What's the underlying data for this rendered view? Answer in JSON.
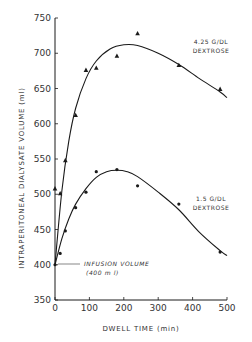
{
  "chart_data": {
    "type": "scatter",
    "title": "",
    "xlabel": "DWELL TIME (min)",
    "ylabel": "INTRAPERITONEAL DIALYSATE VOLUME (ml)",
    "xlim": [
      0,
      500
    ],
    "ylim": [
      350,
      750
    ],
    "xticks": [
      0,
      100,
      200,
      300,
      400,
      500
    ],
    "yticks": [
      350,
      400,
      450,
      500,
      550,
      600,
      650,
      700,
      750
    ],
    "grid": false,
    "legend": "none (series labeled inline)",
    "series": [
      {
        "name": "4.25 G/DL DEXTROSE",
        "marker": "triangle",
        "points": [
          {
            "x": 0,
            "y": 508
          },
          {
            "x": 15,
            "y": 501
          },
          {
            "x": 30,
            "y": 548
          },
          {
            "x": 60,
            "y": 612
          },
          {
            "x": 90,
            "y": 676
          },
          {
            "x": 120,
            "y": 679
          },
          {
            "x": 180,
            "y": 696
          },
          {
            "x": 240,
            "y": 728
          },
          {
            "x": 360,
            "y": 683
          },
          {
            "x": 480,
            "y": 649
          }
        ],
        "fit_curve": [
          {
            "x": 0,
            "y": 400
          },
          {
            "x": 20,
            "y": 505
          },
          {
            "x": 40,
            "y": 575
          },
          {
            "x": 60,
            "y": 622
          },
          {
            "x": 90,
            "y": 664
          },
          {
            "x": 120,
            "y": 689
          },
          {
            "x": 160,
            "y": 706
          },
          {
            "x": 200,
            "y": 712
          },
          {
            "x": 240,
            "y": 711
          },
          {
            "x": 300,
            "y": 700
          },
          {
            "x": 360,
            "y": 684
          },
          {
            "x": 420,
            "y": 664
          },
          {
            "x": 480,
            "y": 645
          },
          {
            "x": 500,
            "y": 637
          }
        ]
      },
      {
        "name": "1.5 G/DL DEXTROSE",
        "marker": "dot",
        "points": [
          {
            "x": 0,
            "y": 400
          },
          {
            "x": 15,
            "y": 416
          },
          {
            "x": 30,
            "y": 448
          },
          {
            "x": 60,
            "y": 481
          },
          {
            "x": 90,
            "y": 503
          },
          {
            "x": 120,
            "y": 532
          },
          {
            "x": 180,
            "y": 535
          },
          {
            "x": 240,
            "y": 512
          },
          {
            "x": 360,
            "y": 486
          },
          {
            "x": 480,
            "y": 418
          }
        ],
        "fit_curve": [
          {
            "x": 0,
            "y": 400
          },
          {
            "x": 20,
            "y": 437
          },
          {
            "x": 40,
            "y": 465
          },
          {
            "x": 60,
            "y": 486
          },
          {
            "x": 90,
            "y": 508
          },
          {
            "x": 120,
            "y": 524
          },
          {
            "x": 150,
            "y": 532
          },
          {
            "x": 180,
            "y": 534
          },
          {
            "x": 210,
            "y": 532
          },
          {
            "x": 240,
            "y": 525
          },
          {
            "x": 300,
            "y": 503
          },
          {
            "x": 360,
            "y": 478
          },
          {
            "x": 420,
            "y": 446
          },
          {
            "x": 480,
            "y": 420
          },
          {
            "x": 500,
            "y": 413
          }
        ]
      }
    ],
    "annotations": [
      {
        "text": "4.25 G/DL",
        "text2": "DEXTROSE",
        "near": "upper curve"
      },
      {
        "text": "1.5 G/DL",
        "text2": "DEXTROSE",
        "near": "lower curve"
      },
      {
        "text": "INFUSION VOLUME",
        "text2": "(400 ml)",
        "points_to": {
          "x": 0,
          "y": 400
        }
      }
    ]
  },
  "labels": {
    "xlabel": "DWELL TIME (min)",
    "ylabel": "INTRAPERITONEAL DIALYSATE VOLUME (ml)",
    "upper_series_line1": "4.25 G/DL",
    "upper_series_line2": "DEXTROSE",
    "lower_series_line1": "1.5 G/DL",
    "lower_series_line2": "DEXTROSE",
    "infusion_line1": "INFUSION VOLUME",
    "infusion_line2": "(400 m l)"
  },
  "colors": {
    "ink": "#1a1a1a",
    "background": "#ffffff"
  }
}
